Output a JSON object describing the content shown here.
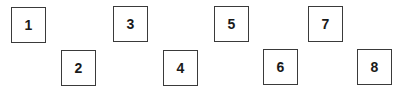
{
  "boxes": [
    {
      "label": "1",
      "x": 11,
      "y": 7
    },
    {
      "label": "2",
      "x": 61,
      "y": 50
    },
    {
      "label": "3",
      "x": 113,
      "y": 6
    },
    {
      "label": "4",
      "x": 163,
      "y": 50
    },
    {
      "label": "5",
      "x": 214,
      "y": 6
    },
    {
      "label": "6",
      "x": 263,
      "y": 49
    },
    {
      "label": "7",
      "x": 308,
      "y": 6
    },
    {
      "label": "8",
      "x": 357,
      "y": 49
    }
  ],
  "colors": {
    "border": "#3a3a3a",
    "text": "#1a1a1a",
    "background": "#ffffff"
  }
}
